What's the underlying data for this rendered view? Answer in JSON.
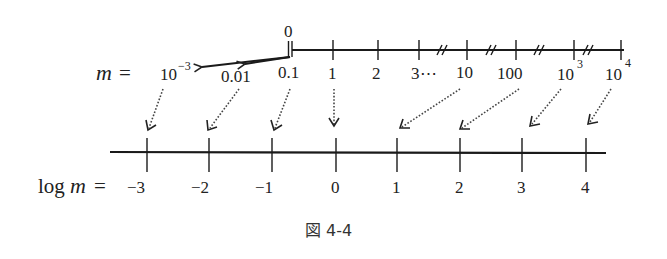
{
  "figure": {
    "caption": "図 4-4",
    "top_axis": {
      "label_lhs": "m",
      "label_eq": "=",
      "origin_label": "0",
      "ticks": [
        {
          "label": "10",
          "sup": "−3"
        },
        {
          "label": "0.01",
          "sup": ""
        },
        {
          "label": "0.1",
          "sup": ""
        },
        {
          "label": "1",
          "sup": ""
        },
        {
          "label": "2",
          "sup": ""
        },
        {
          "label": "3⋯",
          "sup": ""
        },
        {
          "label": "10",
          "sup": ""
        },
        {
          "label": "100",
          "sup": ""
        },
        {
          "label": "10",
          "sup": "3"
        },
        {
          "label": "10",
          "sup": "4"
        }
      ],
      "break_mark": "//"
    },
    "bottom_axis": {
      "label_log": "log",
      "label_m": "m",
      "label_eq": "=",
      "ticks": [
        "−3",
        "−2",
        "−1",
        "0",
        "1",
        "2",
        "3",
        "4"
      ]
    }
  }
}
